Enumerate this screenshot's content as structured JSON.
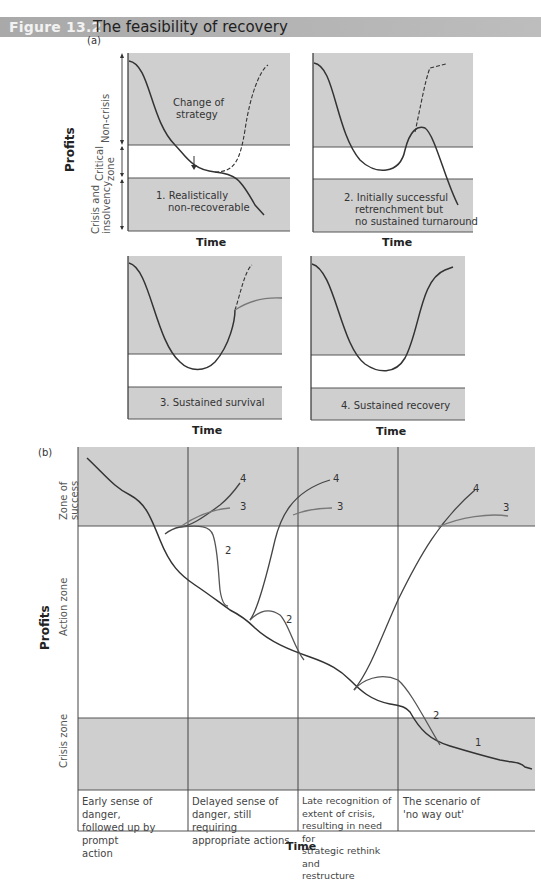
{
  "figure": {
    "number": "Figure 13.2",
    "title": "The feasibility of recovery"
  },
  "panel_a": {
    "label": "(a)",
    "y_axis_label": "Profits",
    "x_axis_label": "Time",
    "zones": [
      "Non-crisis",
      "Critical zone",
      "Crisis and insolvency"
    ],
    "charts": [
      {
        "id": 1,
        "caption_line1": "1. Realistically",
        "caption_line2": "non-recoverable",
        "annotation": "Change of strategy",
        "annotation_line1": "Change of",
        "annotation_line2": "strategy"
      },
      {
        "id": 2,
        "caption_line1": "2. Initially successful",
        "caption_line2": "retrenchment but",
        "caption_line3": "no sustained turnaround"
      },
      {
        "id": 3,
        "caption": "3. Sustained survival"
      },
      {
        "id": 4,
        "caption": "4. Sustained recovery"
      }
    ]
  },
  "panel_b": {
    "label": "(b)",
    "y_axis_label": "Profits",
    "x_axis_label": "Time",
    "zones": [
      "Zone of success",
      "Action zone",
      "Crisis zone"
    ],
    "curve_labels": [
      "1",
      "2",
      "3",
      "4"
    ],
    "stages": [
      {
        "line1": "Early sense of danger,",
        "line2": "followed up by prompt",
        "line3": "action"
      },
      {
        "line1": "Delayed sense of",
        "line2": "danger, still requiring",
        "line3": "appropriate actions"
      },
      {
        "line1": "Late recognition of",
        "line2": "extent of crisis,",
        "line3": "resulting in need for",
        "line4": "strategic rethink and",
        "line5": "restructure"
      },
      {
        "line1": "The scenario of",
        "line2": "'no way out'"
      }
    ]
  },
  "colors": {
    "title_bar": "#b0b0b0",
    "zone_fill": "#cfcfcf",
    "curve_main": "#3a3a3a",
    "curve_alt": "#6e6e6e"
  }
}
